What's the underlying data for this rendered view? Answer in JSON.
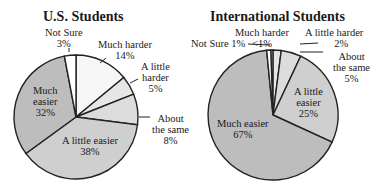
{
  "chart_data": [
    {
      "type": "pie",
      "title": "U.S. Students",
      "categories": [
        "Much harder",
        "A little harder",
        "About the same",
        "A little easier",
        "Much easier",
        "Not Sure"
      ],
      "values": [
        14,
        5,
        8,
        38,
        32,
        3
      ],
      "colors": [
        "#f6f6f6",
        "#e6e6e6",
        "#dcdcdc",
        "#cfcfcf",
        "#bdbdbd",
        "#ffffff"
      ],
      "labels": {
        "much_harder": [
          "Much harder",
          "14%"
        ],
        "little_harder": [
          "A little",
          "harder",
          "5%"
        ],
        "about_same": [
          "About",
          "the same",
          "8%"
        ],
        "little_easier": [
          "A little easier",
          "38%"
        ],
        "much_easier": [
          "Much",
          "easier",
          "32%"
        ],
        "not_sure": [
          "Not Sure",
          "3%"
        ]
      }
    },
    {
      "type": "pie",
      "title": "International Students",
      "categories": [
        "Much harder",
        "A little harder",
        "About the same",
        "A little easier",
        "Much easier",
        "Not Sure"
      ],
      "values": [
        0.6,
        2,
        5,
        25,
        67,
        1
      ],
      "value_labels": [
        "<1%",
        "2%",
        "5%",
        "25%",
        "67%",
        "1%"
      ],
      "colors": [
        "#f6f6f6",
        "#e6e6e6",
        "#dcdcdc",
        "#cfcfcf",
        "#bdbdbd",
        "#ffffff"
      ],
      "labels": {
        "much_harder": [
          "Much harder",
          "<1%"
        ],
        "little_harder": [
          "A little harder",
          "2%"
        ],
        "about_same": [
          "About",
          "the same",
          "5%"
        ],
        "little_easier": [
          "A little",
          "easier",
          "25%"
        ],
        "much_easier": [
          "Much easier",
          "67%"
        ],
        "not_sure": [
          "Not Sure 1%"
        ]
      }
    }
  ]
}
